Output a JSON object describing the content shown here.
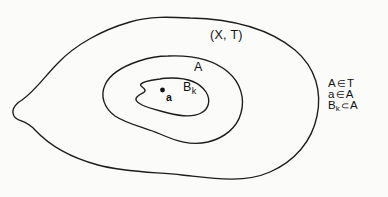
{
  "diagram": {
    "background_color": "#fbfbf9",
    "stroke_color": "#1c1c1c",
    "labels": {
      "space": "(X, T)",
      "open_set": "A",
      "basis_element_base": "B",
      "basis_element_sub": "k",
      "point": "a"
    },
    "regions": [
      {
        "name": "ambient-space-X",
        "label": "(X, T)",
        "role": "outer-blob"
      },
      {
        "name": "open-set-A",
        "label": "A",
        "role": "middle-blob"
      },
      {
        "name": "basis-element-Bk",
        "label": "Bk",
        "role": "inner-blob"
      },
      {
        "name": "point-a",
        "label": "a",
        "role": "point"
      }
    ],
    "relations": [
      {
        "left": "A",
        "symbol": "∈",
        "right": "T",
        "text": "A ∈ T"
      },
      {
        "left": "a",
        "symbol": "∈",
        "right": "A",
        "text": "a ∈ A"
      },
      {
        "left": "B",
        "left_sub": "k",
        "symbol": "⊂",
        "right": "A",
        "text": "Bₖ ⊂ A"
      }
    ],
    "relation_symbols": {
      "element_of": "∈",
      "subset_of": "⊂"
    }
  }
}
